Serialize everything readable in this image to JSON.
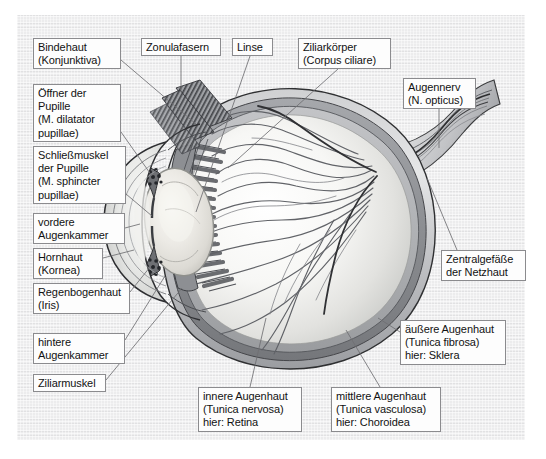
{
  "figure": {
    "kind": "anatomical-diagram",
    "language": "de",
    "panel": {
      "background_color": "#ececed",
      "border_color": "#ffffff"
    },
    "label_style": {
      "box_fill": "#fdfdfd",
      "box_border": "#8b8b8e",
      "text_color": "#121212",
      "leader_line_color": "#6f6f72"
    },
    "illustration": {
      "palette": {
        "sclera_outer": "#b9babc",
        "sclera_mid": "#d2d3d4",
        "choroid": "#8e9093",
        "retina": "#a9abae",
        "vitreous_light": "#fbfbfa",
        "vitreous_shade": "#d8d9d7",
        "lens_fill": "#efeeea",
        "lens_edge": "#9a9a98",
        "ciliary_body": "#7d7f82",
        "zonula": "#6d6f73",
        "vessel": "#5d5f63",
        "optic_nerve": "#c6c7c9",
        "outline": "#2b2c2e"
      },
      "parts": [
        "Kornea",
        "vordere Augenkammer",
        "Iris",
        "hintere Augenkammer",
        "Linse",
        "Zonulafasern",
        "Ziliarkörper",
        "Ziliarmuskel",
        "Glaskörper",
        "Retina",
        "Choroidea",
        "Sklera",
        "N. opticus",
        "Zentralgefäße"
      ]
    }
  },
  "labels": [
    {
      "id": "bindehaut",
      "lines": [
        "Bindehaut",
        "(Konjunktiva)"
      ],
      "x": 33,
      "y": 38,
      "w": 88,
      "h": 31
    },
    {
      "id": "oeffner-pupille",
      "lines": [
        "Öffner der",
        "Pupille",
        "(M. dilatator",
        "pupillae)"
      ],
      "x": 33,
      "y": 84,
      "w": 88,
      "h": 58
    },
    {
      "id": "schliessmuskel-pupille",
      "lines": [
        "Schließmuskel",
        "der Pupille",
        "(M. sphincter",
        "pupillae)"
      ],
      "x": 33,
      "y": 146,
      "w": 93,
      "h": 58
    },
    {
      "id": "vordere-augenkammer",
      "lines": [
        "vordere",
        "Augenkammer"
      ],
      "x": 33,
      "y": 213,
      "w": 92,
      "h": 31
    },
    {
      "id": "hornhaut",
      "lines": [
        "Hornhaut",
        "(Kornea)"
      ],
      "x": 33,
      "y": 248,
      "w": 70,
      "h": 31
    },
    {
      "id": "regenbogenhaut",
      "lines": [
        "Regenbogenhaut",
        "(Iris)"
      ],
      "x": 33,
      "y": 283,
      "w": 97,
      "h": 31
    },
    {
      "id": "hintere-augenkammer",
      "lines": [
        "hintere",
        "Augenkammer"
      ],
      "x": 33,
      "y": 333,
      "w": 92,
      "h": 31
    },
    {
      "id": "ziliarmuskel",
      "lines": [
        "Ziliarmuskel"
      ],
      "x": 33,
      "y": 374,
      "w": 73,
      "h": 18
    },
    {
      "id": "zonulafasern",
      "lines": [
        "Zonulafasern"
      ],
      "x": 141,
      "y": 38,
      "w": 80,
      "h": 18
    },
    {
      "id": "linse",
      "lines": [
        "Linse"
      ],
      "x": 232,
      "y": 38,
      "w": 41,
      "h": 18
    },
    {
      "id": "ziliarkoerper",
      "lines": [
        "Ziliarkörper",
        "(Corpus ciliare)"
      ],
      "x": 298,
      "y": 38,
      "w": 93,
      "h": 31
    },
    {
      "id": "augennerv",
      "lines": [
        "Augennerv",
        "(N. opticus)"
      ],
      "x": 403,
      "y": 78,
      "w": 73,
      "h": 31
    },
    {
      "id": "zentralgefaesse",
      "lines": [
        "Zentralgefäße",
        "der Netzhaut"
      ],
      "x": 441,
      "y": 250,
      "w": 85,
      "h": 31
    },
    {
      "id": "aeussere-augenhaut",
      "lines": [
        "äußere Augenhaut",
        "(Tunica fibrosa)",
        "hier: Sklera"
      ],
      "x": 400,
      "y": 320,
      "w": 106,
      "h": 45
    },
    {
      "id": "innere-augenhaut",
      "lines": [
        "innere Augenhaut",
        "(Tunica nervosa)",
        "hier: Retina"
      ],
      "x": 198,
      "y": 387,
      "w": 104,
      "h": 45
    },
    {
      "id": "mittlere-augenhaut",
      "lines": [
        "mittlere Augenhaut",
        "(Tunica vasculosa)",
        "hier: Choroidea"
      ],
      "x": 331,
      "y": 387,
      "w": 110,
      "h": 45
    }
  ]
}
